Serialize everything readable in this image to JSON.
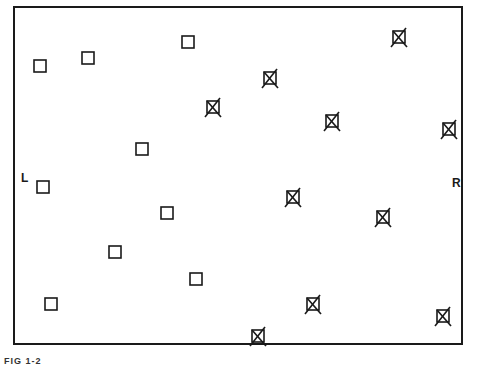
{
  "figure": {
    "caption": "FIG 1-2",
    "left_label": "L",
    "right_label": "R",
    "stroke_color": "#1a1a1a"
  },
  "markers": {
    "open_squares": [
      {
        "x": 40,
        "y": 66
      },
      {
        "x": 88,
        "y": 58
      },
      {
        "x": 188,
        "y": 42
      },
      {
        "x": 142,
        "y": 149
      },
      {
        "x": 43,
        "y": 187
      },
      {
        "x": 167,
        "y": 213
      },
      {
        "x": 115,
        "y": 252
      },
      {
        "x": 196,
        "y": 279
      },
      {
        "x": 51,
        "y": 304
      }
    ],
    "crossed_squares": [
      {
        "x": 399,
        "y": 37
      },
      {
        "x": 270,
        "y": 78
      },
      {
        "x": 332,
        "y": 121
      },
      {
        "x": 213,
        "y": 107
      },
      {
        "x": 449,
        "y": 129
      },
      {
        "x": 293,
        "y": 197
      },
      {
        "x": 383,
        "y": 217
      },
      {
        "x": 313,
        "y": 304
      },
      {
        "x": 443,
        "y": 316
      },
      {
        "x": 258,
        "y": 336
      }
    ]
  }
}
